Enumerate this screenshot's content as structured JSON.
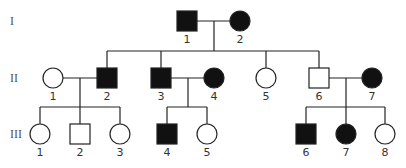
{
  "diagram": {
    "type": "pedigree",
    "colors": {
      "affected": "#111111",
      "unaffected": "#ffffff",
      "stroke": "#222222"
    },
    "generations": [
      {
        "label": "I",
        "y": 21
      },
      {
        "label": "II",
        "y": 78
      },
      {
        "label": "III",
        "y": 134
      }
    ],
    "individuals": [
      {
        "id": "I-1",
        "gen": 0,
        "num": "1",
        "sex": "male",
        "affected": true,
        "x": 187
      },
      {
        "id": "I-2",
        "gen": 0,
        "num": "2",
        "sex": "female",
        "affected": true,
        "x": 240
      },
      {
        "id": "II-1",
        "gen": 1,
        "num": "1",
        "sex": "female",
        "affected": false,
        "x": 53
      },
      {
        "id": "II-2",
        "gen": 1,
        "num": "2",
        "sex": "male",
        "affected": true,
        "x": 107
      },
      {
        "id": "II-3",
        "gen": 1,
        "num": "3",
        "sex": "male",
        "affected": true,
        "x": 161
      },
      {
        "id": "II-4",
        "gen": 1,
        "num": "4",
        "sex": "female",
        "affected": true,
        "x": 214
      },
      {
        "id": "II-5",
        "gen": 1,
        "num": "5",
        "sex": "female",
        "affected": false,
        "x": 266
      },
      {
        "id": "II-6",
        "gen": 1,
        "num": "6",
        "sex": "male",
        "affected": false,
        "x": 319
      },
      {
        "id": "II-7",
        "gen": 1,
        "num": "7",
        "sex": "female",
        "affected": true,
        "x": 372
      },
      {
        "id": "III-1",
        "gen": 2,
        "num": "1",
        "sex": "female",
        "affected": false,
        "x": 40
      },
      {
        "id": "III-2",
        "gen": 2,
        "num": "2",
        "sex": "male",
        "affected": false,
        "x": 80
      },
      {
        "id": "III-3",
        "gen": 2,
        "num": "3",
        "sex": "female",
        "affected": false,
        "x": 120
      },
      {
        "id": "III-4",
        "gen": 2,
        "num": "4",
        "sex": "male",
        "affected": true,
        "x": 167
      },
      {
        "id": "III-5",
        "gen": 2,
        "num": "5",
        "sex": "female",
        "affected": false,
        "x": 207
      },
      {
        "id": "III-6",
        "gen": 2,
        "num": "6",
        "sex": "male",
        "affected": true,
        "x": 306
      },
      {
        "id": "III-7",
        "gen": 2,
        "num": "7",
        "sex": "female",
        "affected": true,
        "x": 346
      },
      {
        "id": "III-8",
        "gen": 2,
        "num": "8",
        "sex": "female",
        "affected": false,
        "x": 385
      }
    ],
    "matings": [
      {
        "a": "I-1",
        "b": "I-2",
        "children": [
          "II-2",
          "II-3",
          "II-5",
          "II-6"
        ]
      },
      {
        "a": "II-1",
        "b": "II-2",
        "children": [
          "III-1",
          "III-2",
          "III-3"
        ]
      },
      {
        "a": "II-3",
        "b": "II-4",
        "children": [
          "III-4",
          "III-5"
        ]
      },
      {
        "a": "II-6",
        "b": "II-7",
        "children": [
          "III-6",
          "III-7",
          "III-8"
        ]
      }
    ]
  }
}
